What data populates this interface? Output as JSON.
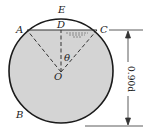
{
  "diagram": {
    "labels": {
      "A": "A",
      "B": "B",
      "C": "C",
      "D": "D",
      "E": "E",
      "O": "O",
      "theta": "θ"
    },
    "dimension": {
      "text": "0.90d",
      "orientation": "vertical, rotated 90°"
    },
    "colors": {
      "fill": "#d4d4d4",
      "stroke": "#1a1a1a",
      "background": "#ffffff"
    }
  }
}
